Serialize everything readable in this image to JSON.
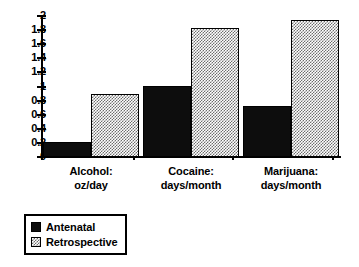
{
  "chart_data": {
    "type": "bar",
    "title": "",
    "xlabel": "",
    "ylabel": "",
    "ylim": [
      0,
      2
    ],
    "ytick_step": 0.2,
    "grid": false,
    "legend_position": "bottom-left",
    "categories": [
      "Alcohol: oz/day",
      "Cocaine: days/month",
      "Marijuana: days/month"
    ],
    "category_lines": [
      [
        "Alcohol:",
        "oz/day"
      ],
      [
        "Cocaine:",
        "days/month"
      ],
      [
        "Marijuana:",
        "days/month"
      ]
    ],
    "ytick_labels": [
      "2",
      "1.8",
      "1.6",
      "1.4",
      "1.2",
      "1",
      "0.8",
      "0.6",
      "0.4",
      "0.2",
      "0"
    ],
    "ytick_values": [
      2,
      1.8,
      1.6,
      1.4,
      1.2,
      1,
      0.8,
      0.6,
      0.4,
      0.2,
      0
    ],
    "series": [
      {
        "name": "Antenatal",
        "values": [
          0.21,
          1.01,
          0.73
        ],
        "color": "#0d0d0d",
        "fill": "solid-black"
      },
      {
        "name": "Retrospective",
        "values": [
          0.9,
          1.83,
          1.94
        ],
        "color": "#6e6e6e",
        "fill": "gray-checker"
      }
    ]
  },
  "legend": {
    "items": [
      {
        "label": "Antenatal",
        "fill": "solid-black"
      },
      {
        "label": "Retrospective",
        "fill": "gray-checker"
      }
    ]
  },
  "axis": {
    "y_max_label": "2",
    "y_min_label": "0"
  }
}
